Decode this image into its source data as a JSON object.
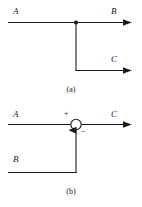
{
  "figure": {
    "background_color": "#ffffff",
    "stroke_color": "#1a1a1a",
    "panels": [
      {
        "id": "panel-a",
        "caption": "(a)",
        "kind": "branch-point",
        "description": "Signal takeoff point: input A splits into outputs B and C",
        "input_label": "A",
        "output_labels": [
          "B",
          "C"
        ]
      },
      {
        "id": "panel-b",
        "caption": "(b)",
        "kind": "summing-junction",
        "description": "Summing junction: C equals A minus B",
        "input_labels": [
          "A",
          "B"
        ],
        "output_label": "C",
        "sign_a": "+",
        "sign_b": "−"
      }
    ]
  },
  "panel_a": {
    "label_a": "A",
    "label_b": "B",
    "label_c": "C",
    "caption": "(a)"
  },
  "panel_b": {
    "label_a": "A",
    "label_b": "B",
    "label_c": "C",
    "sign_plus": "+",
    "sign_minus": "−",
    "caption": "(b)"
  }
}
